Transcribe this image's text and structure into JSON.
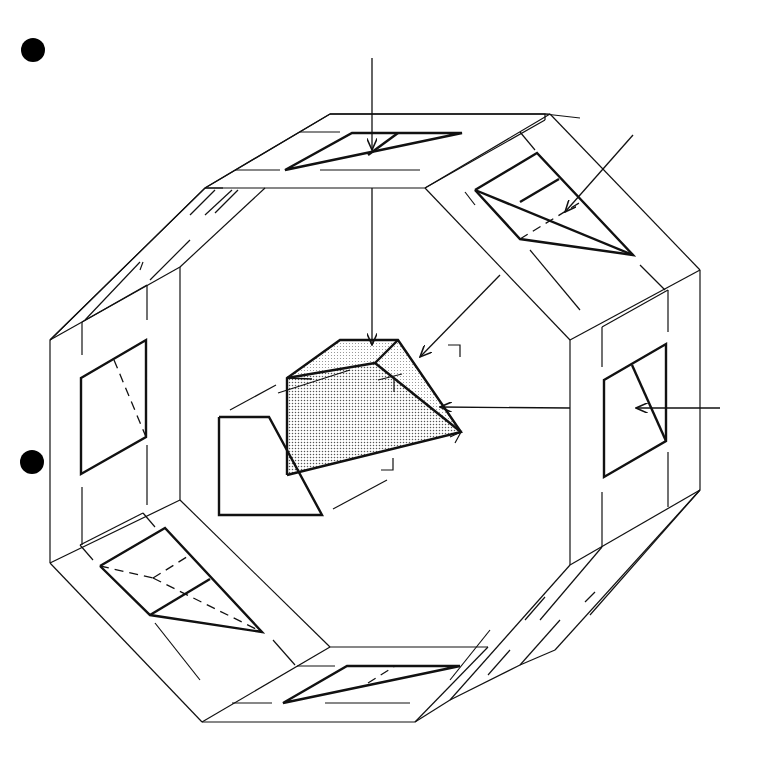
{
  "diagram": {
    "colors": {
      "line": "#111111",
      "background": "#ffffff",
      "object_fill": "#d9d9d9",
      "object_fill_light": "#ebebeb"
    },
    "bullets": [
      {
        "name": "bullet-top",
        "cx": 33,
        "cy": 50,
        "r": 12
      },
      {
        "name": "bullet-middle",
        "cx": 32,
        "cy": 462,
        "r": 12
      }
    ],
    "views": [
      "top-view",
      "top-right-view",
      "right-side-view",
      "bottom-right-view",
      "bottom-view",
      "bottom-left-view",
      "left-side-view",
      "top-left-view"
    ],
    "labels": []
  }
}
